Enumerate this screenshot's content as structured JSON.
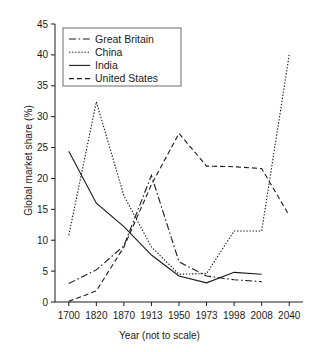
{
  "chart_data": {
    "type": "line",
    "title": "",
    "xlabel": "Year (not to scale)",
    "ylabel": "Global market share (%)",
    "categories": [
      "1700",
      "1820",
      "1870",
      "1913",
      "1950",
      "1973",
      "1998",
      "2008",
      "2040"
    ],
    "ylim": [
      0,
      45
    ],
    "yticks": [
      "0",
      "5",
      "10",
      "15",
      "20",
      "25",
      "30",
      "35",
      "40",
      "45"
    ],
    "grid": false,
    "legend_position": "top-left",
    "x_note": "not to scale (ordinal category spacing)",
    "series": [
      {
        "name": "Great Britain",
        "style": "dash-dot",
        "values": [
          3.0,
          5.2,
          9.1,
          20.5,
          6.5,
          4.2,
          3.6,
          3.3,
          null
        ]
      },
      {
        "name": "China",
        "style": "dotted",
        "values": [
          10.8,
          32.4,
          17.2,
          8.9,
          4.5,
          4.6,
          11.5,
          11.5,
          40.0
        ]
      },
      {
        "name": "India",
        "style": "solid",
        "values": [
          24.4,
          16.0,
          12.2,
          7.6,
          4.2,
          3.1,
          4.8,
          4.5,
          null
        ]
      },
      {
        "name": "United States",
        "style": "dashed",
        "values": [
          0.1,
          1.8,
          8.9,
          19.0,
          27.3,
          22.0,
          21.9,
          21.6,
          14.0
        ]
      }
    ]
  },
  "legend": {
    "items": [
      {
        "label": "Great Britain"
      },
      {
        "label": "China"
      },
      {
        "label": "India"
      },
      {
        "label": "United States"
      }
    ]
  }
}
